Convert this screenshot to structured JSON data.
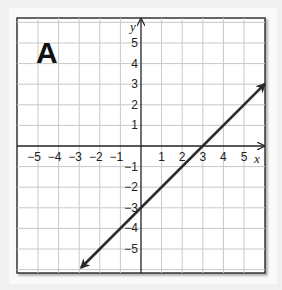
{
  "panel_label": "A",
  "chart_data": {
    "type": "line",
    "title": "A",
    "xlabel": "x",
    "ylabel": "y",
    "xlim": [
      -6,
      6
    ],
    "ylim": [
      -6,
      6
    ],
    "grid": true,
    "x_ticks": [
      "-5",
      "-4",
      "-3",
      "-2",
      "-1",
      "1",
      "2",
      "3",
      "4",
      "5"
    ],
    "y_ticks": [
      "5",
      "4",
      "3",
      "2",
      "1",
      "-1",
      "-2",
      "-3",
      "-4",
      "-5"
    ],
    "series": [
      {
        "name": "line",
        "equation": "y = x - 3",
        "points": [
          [
            -2.9,
            -5.9
          ],
          [
            0,
            -3
          ],
          [
            3,
            0
          ],
          [
            6,
            3
          ]
        ],
        "arrows": "both",
        "color": "#2a2a2a"
      }
    ]
  },
  "colors": {
    "grid": "#c8c8c8",
    "axis": "#222222",
    "frame": "#333333",
    "line": "#2a2a2a"
  }
}
